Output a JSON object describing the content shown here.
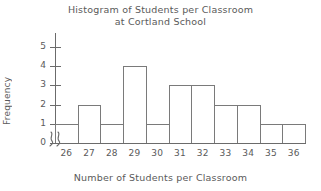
{
  "chart_data": {
    "type": "bar",
    "title": "Histogram of Students per Classroom at Cortland School",
    "title_line1": "Histogram of Students per Classroom",
    "title_line2": "at Cortland School",
    "xlabel": "Number of Students per Classroom",
    "ylabel": "Frequency",
    "categories": [
      "26",
      "27",
      "28",
      "29",
      "30",
      "31",
      "32",
      "33",
      "34",
      "35",
      "36"
    ],
    "values": [
      1,
      2,
      1,
      4,
      1,
      3,
      3,
      2,
      2,
      1,
      1
    ],
    "ylim": [
      0,
      5
    ],
    "ytick_labels": [
      "0",
      "1",
      "2",
      "3",
      "4",
      "5"
    ],
    "ytick_values": [
      0,
      1,
      2,
      3,
      4,
      5
    ],
    "grid": false,
    "legend": null,
    "axis_break": {
      "axis": "x",
      "symbol": "squiggle",
      "note": "break between origin and first bar"
    },
    "colors": {
      "background": "#ffffff",
      "axis": "#6b6b6b",
      "bar_outline": "#7a7a7a",
      "bar_fill": "#ffffff",
      "text": "#5a5a5a"
    }
  }
}
